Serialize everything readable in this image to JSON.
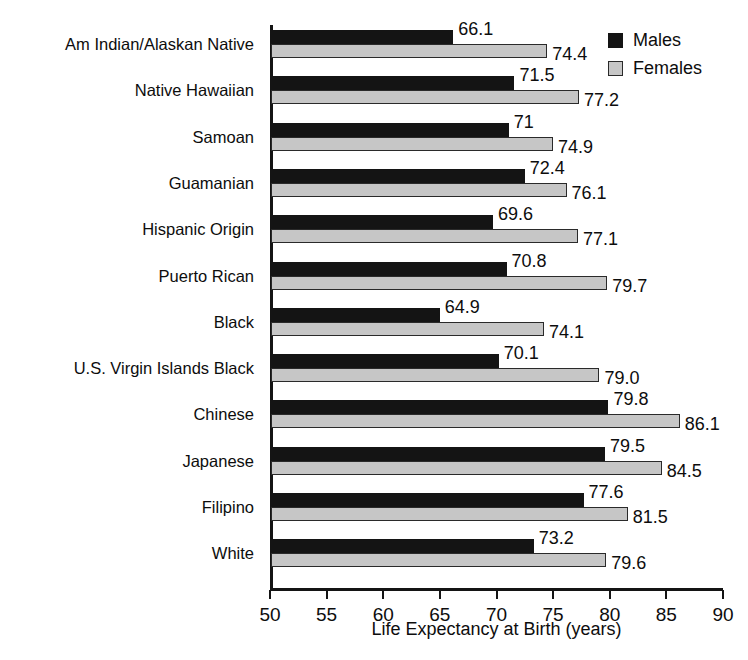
{
  "chart_data": {
    "type": "bar",
    "orientation": "horizontal",
    "title": "",
    "xlabel": "Life Expectancy at Birth (years)",
    "ylabel": "",
    "xlim": [
      50,
      90
    ],
    "xticks": [
      50,
      55,
      60,
      65,
      70,
      75,
      80,
      85,
      90
    ],
    "grid": false,
    "legend_position": "top-right",
    "categories": [
      "Am Indian/Alaskan Native",
      "Native Hawaiian",
      "Samoan",
      "Guamanian",
      "Hispanic Origin",
      "Puerto Rican",
      "Black",
      "U.S. Virgin Islands Black",
      "Chinese",
      "Japanese",
      "Filipino",
      "White"
    ],
    "series": [
      {
        "name": "Males",
        "color": "#141414",
        "values": [
          66.1,
          71.5,
          71,
          72.4,
          69.6,
          70.8,
          64.9,
          70.1,
          79.8,
          79.5,
          77.6,
          73.2
        ],
        "labels": [
          "66.1",
          "71.5",
          "71",
          "72.4",
          "69.6",
          "70.8",
          "64.9",
          "70.1",
          "79.8",
          "79.5",
          "77.6",
          "73.2"
        ]
      },
      {
        "name": "Females",
        "color": "#c6c6c6",
        "values": [
          74.4,
          77.2,
          74.9,
          76.1,
          77.1,
          79.7,
          74.1,
          79.0,
          86.1,
          84.5,
          81.5,
          79.6
        ],
        "labels": [
          "74.4",
          "77.2",
          "74.9",
          "76.1",
          "77.1",
          "79.7",
          "74.1",
          "79.0",
          "86.1",
          "84.5",
          "81.5",
          "79.6"
        ]
      }
    ]
  },
  "legend": {
    "items": [
      {
        "label": "Males",
        "swatch": "males"
      },
      {
        "label": "Females",
        "swatch": "females"
      }
    ]
  }
}
